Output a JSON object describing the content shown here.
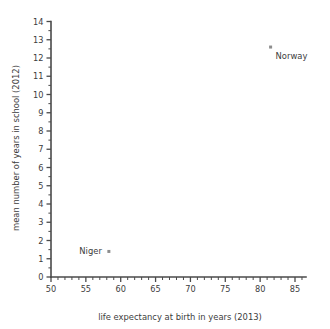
{
  "chart_data": {
    "type": "scatter",
    "title": "",
    "xlabel": "life expectancy at birth in years (2013)",
    "ylabel": "mean number of years in school (2012)",
    "xlim": [
      50,
      87
    ],
    "ylim": [
      0,
      14
    ],
    "grid": false,
    "legend": "none",
    "x_ticks": [
      50,
      55,
      60,
      65,
      70,
      75,
      80,
      85
    ],
    "x_tick_labels": [
      "50",
      "55",
      "60",
      "65",
      "70",
      "75",
      "80",
      "85"
    ],
    "x_minor_step": 1,
    "y_ticks": [
      0,
      1,
      2,
      3,
      4,
      5,
      6,
      7,
      8,
      9,
      10,
      11,
      12,
      13,
      14
    ],
    "y_tick_labels": [
      "0",
      "1",
      "2",
      "3",
      "4",
      "5",
      "6",
      "7",
      "8",
      "9",
      "10",
      "11",
      "12",
      "13",
      "14"
    ],
    "y_minor_step": 0.5,
    "marker_color": "#8d8d8d",
    "axis_color": "#4a4a4a",
    "text_color": "#3c3c3c",
    "points": [
      {
        "name": "Niger",
        "x": 58.3,
        "y": 1.4,
        "label": "Niger",
        "label_position": "left"
      },
      {
        "name": "Norway",
        "x": 81.5,
        "y": 12.6,
        "label": "Norway",
        "label_position": "below-right"
      }
    ]
  }
}
